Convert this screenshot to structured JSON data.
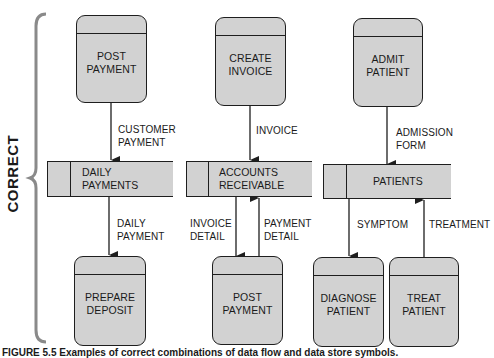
{
  "side_label": "CORRECT",
  "caption": "FIGURE 5.5 Examples of correct combinations of data flow and data store symbols.",
  "colors": {
    "symbol_fill": "#d2d2d2",
    "line": "#1e1e1e",
    "brace": "#8a8a8a"
  },
  "columns": [
    {
      "top_process": {
        "label_1": "POST",
        "label_2": "PAYMENT"
      },
      "flow_in": {
        "label_1": "CUSTOMER",
        "label_2": "PAYMENT"
      },
      "store": {
        "label_1": "DAILY",
        "label_2": "PAYMENTS"
      },
      "flow_out": {
        "label_1": "DAILY",
        "label_2": "PAYMENT"
      },
      "bottom_process": {
        "label_1": "PREPARE",
        "label_2": "DEPOSIT"
      }
    },
    {
      "top_process": {
        "label_1": "CREATE",
        "label_2": "INVOICE"
      },
      "flow_in": {
        "label_1": "INVOICE"
      },
      "store": {
        "label_1": "ACCOUNTS",
        "label_2": "RECEIVABLE"
      },
      "flow_down": {
        "label_1": "INVOICE",
        "label_2": "DETAIL"
      },
      "flow_up": {
        "label_1": "PAYMENT",
        "label_2": "DETAIL"
      },
      "bottom_process": {
        "label_1": "POST",
        "label_2": "PAYMENT"
      }
    },
    {
      "top_process": {
        "label_1": "ADMIT",
        "label_2": "PATIENT"
      },
      "flow_in": {
        "label_1": "ADMISSION",
        "label_2": "FORM"
      },
      "store": {
        "label_1": "PATIENTS"
      },
      "flow_down": {
        "label_1": "SYMPTOM"
      },
      "flow_up": {
        "label_1": "TREATMENT"
      },
      "bottom_process_left": {
        "label_1": "DIAGNOSE",
        "label_2": "PATIENT"
      },
      "bottom_process_right": {
        "label_1": "TREAT",
        "label_2": "PATIENT"
      }
    }
  ]
}
